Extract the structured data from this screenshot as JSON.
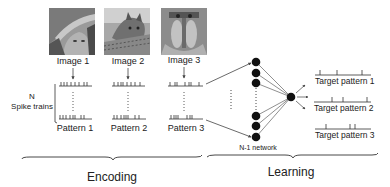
{
  "encoding": {
    "section_label": "Encoding",
    "spike_axis_label_line1": "N",
    "spike_axis_label_line2": "Spike trains",
    "images": [
      {
        "label": "Image 1",
        "pattern_label": "Pattern 1",
        "thumbnail": "portrait-photo"
      },
      {
        "label": "Image 2",
        "pattern_label": "Pattern 2",
        "thumbnail": "cat-photo"
      },
      {
        "label": "Image 3",
        "pattern_label": "Pattern 3",
        "thumbnail": "mandrill-photo"
      }
    ]
  },
  "learning": {
    "section_label": "Learning",
    "network_label": "N-1 network",
    "targets": [
      {
        "label": "Target pattern 1"
      },
      {
        "label": "Target pattern 2"
      },
      {
        "label": "Target pattern 3"
      }
    ]
  },
  "colors": {
    "ink": "#222222",
    "node": "#111111",
    "line": "#555555"
  }
}
